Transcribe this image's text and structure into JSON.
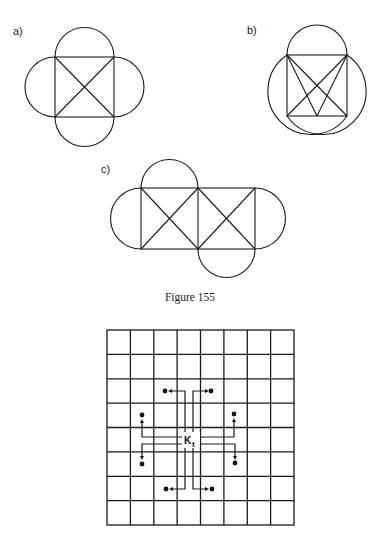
{
  "figures": {
    "a": {
      "label": "a)"
    },
    "b": {
      "label": "b)"
    },
    "c": {
      "label": "c)"
    }
  },
  "caption": "Figure 155",
  "board": {
    "rows": 8,
    "cols": 8,
    "piece_label": "K",
    "piece_subscript": "t",
    "moves": 8
  },
  "colors": {
    "ink": "#1a1a1a",
    "background": "#ffffff"
  }
}
